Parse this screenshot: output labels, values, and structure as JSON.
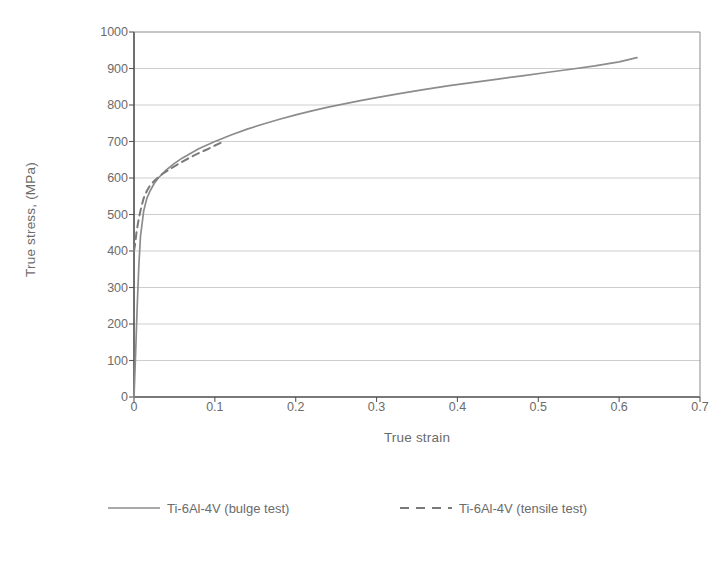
{
  "chart_data": {
    "type": "line",
    "title": "",
    "xlabel": "True strain",
    "ylabel": "True stress, (MPa)",
    "xlim": [
      0,
      0.7
    ],
    "ylim": [
      0,
      1000
    ],
    "xticks": [
      "0",
      "0.1",
      "0.2",
      "0.3",
      "0.4",
      "0.5",
      "0.6",
      "0.7"
    ],
    "xtick_values": [
      0,
      0.1,
      0.2,
      0.3,
      0.4,
      0.5,
      0.6,
      0.7
    ],
    "yticks": [
      "0",
      "100",
      "200",
      "300",
      "400",
      "500",
      "600",
      "700",
      "800",
      "900",
      "1000"
    ],
    "ytick_values": [
      0,
      100,
      200,
      300,
      400,
      500,
      600,
      700,
      800,
      900,
      1000
    ],
    "grid": "horizontal",
    "legend_position": "bottom",
    "series": [
      {
        "name": "Ti-6Al-4V (bulge test)",
        "style": "solid",
        "color": "#8c8c8c",
        "x": [
          0,
          0.002,
          0.004,
          0.006,
          0.008,
          0.012,
          0.016,
          0.02,
          0.025,
          0.03,
          0.04,
          0.05,
          0.06,
          0.08,
          0.1,
          0.12,
          0.14,
          0.16,
          0.18,
          0.2,
          0.22,
          0.24,
          0.26,
          0.28,
          0.3,
          0.33,
          0.36,
          0.39,
          0.42,
          0.45,
          0.48,
          0.51,
          0.54,
          0.57,
          0.6,
          0.622
        ],
        "y": [
          0,
          120,
          250,
          360,
          440,
          510,
          545,
          565,
          585,
          600,
          622,
          640,
          655,
          680,
          700,
          718,
          734,
          748,
          761,
          773,
          784,
          794,
          803,
          812,
          820,
          832,
          843,
          853,
          862,
          871,
          880,
          889,
          898,
          907,
          918,
          930
        ]
      },
      {
        "name": "Ti-6Al-4V (tensile test)",
        "style": "dashed",
        "color": "#7a7a7a",
        "x": [
          0,
          0.0015,
          0.003,
          0.006,
          0.009,
          0.012,
          0.016,
          0.02,
          0.025,
          0.03,
          0.035,
          0.04,
          0.05,
          0.06,
          0.07,
          0.08,
          0.09,
          0.1,
          0.108
        ],
        "y": [
          400,
          420,
          450,
          490,
          520,
          545,
          565,
          580,
          592,
          602,
          611,
          618,
          632,
          645,
          657,
          668,
          678,
          689,
          697
        ]
      }
    ]
  },
  "legend": {
    "entries": [
      {
        "label": "Ti-6Al-4V (bulge test)"
      },
      {
        "label": "Ti-6Al-4V (tensile test)"
      }
    ]
  },
  "axes": {
    "x_title": "True strain",
    "y_title": "True stress, (MPa)"
  }
}
